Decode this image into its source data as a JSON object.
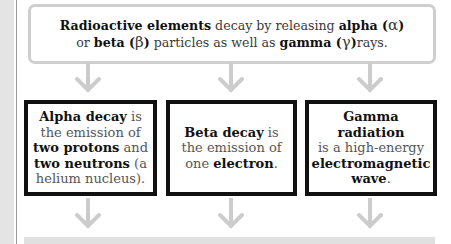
{
  "colors": {
    "accent_border": "#111111",
    "top_box_border": "#cfcfcf",
    "arrow": "#cccccc",
    "left_strip": "#e4e4e4",
    "bottom_bar": "#e0e0e0"
  },
  "intro": {
    "line1": {
      "bold1": "Radioactive elements",
      "text1": " decay by releasing ",
      "bold2": "alpha (",
      "greek": "α",
      "bold3": ")"
    },
    "line2": {
      "text1": "or ",
      "bold1": "beta (",
      "greek1": "β",
      "bold2": ")",
      "text2": " particles as well as ",
      "bold3": "gamma (",
      "greek2": "γ",
      "bold4": ")",
      "text3": "rays."
    }
  },
  "arrows": {
    "icon": "down-arrow-icon",
    "count_upper": 3,
    "count_lower": 3
  },
  "cards": [
    {
      "title": "Alpha decay",
      "t1": " is",
      "t2": "the emission of",
      "b2": "two protons",
      "t3": " and",
      "b3": "two neutrons",
      "t4": " (a",
      "t5": "helium nucleus)."
    },
    {
      "title": "Beta decay",
      "t1": " is",
      "t2": "the emission of",
      "t3": "one ",
      "b2": "electron",
      "t4": "."
    },
    {
      "title": "Gamma radiation",
      "t1": "is a high-energy",
      "b2": "electromagnetic",
      "b3": "wave",
      "t2": "."
    }
  ]
}
